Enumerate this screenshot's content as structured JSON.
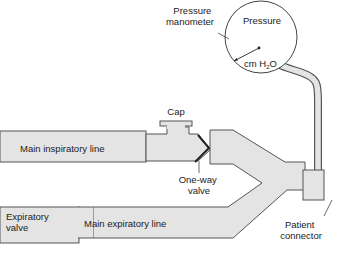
{
  "diagram": {
    "type": "ventilator circuit schematic",
    "labels": {
      "manometer_line1": "Pressure",
      "manometer_line2": "manometer",
      "gauge_title": "Pressure",
      "gauge_unit_prefix": "cm H",
      "gauge_unit_sub": "2",
      "gauge_unit_suffix": "O",
      "cap": "Cap",
      "main_inspiratory_line": "Main inspiratory line",
      "one_way_valve_line1": "One-way",
      "one_way_valve_line2": "valve",
      "expiratory_valve_line1": "Expiratory",
      "expiratory_valve_line2": "valve",
      "main_expiratory_line": "Main expiratory line",
      "patient_connector_line1": "Patient",
      "patient_connector_line2": "connector"
    },
    "colors": {
      "tube_fill": "#e4e4e4",
      "stroke": "#555555",
      "text": "#222222",
      "background": "#ffffff"
    }
  }
}
